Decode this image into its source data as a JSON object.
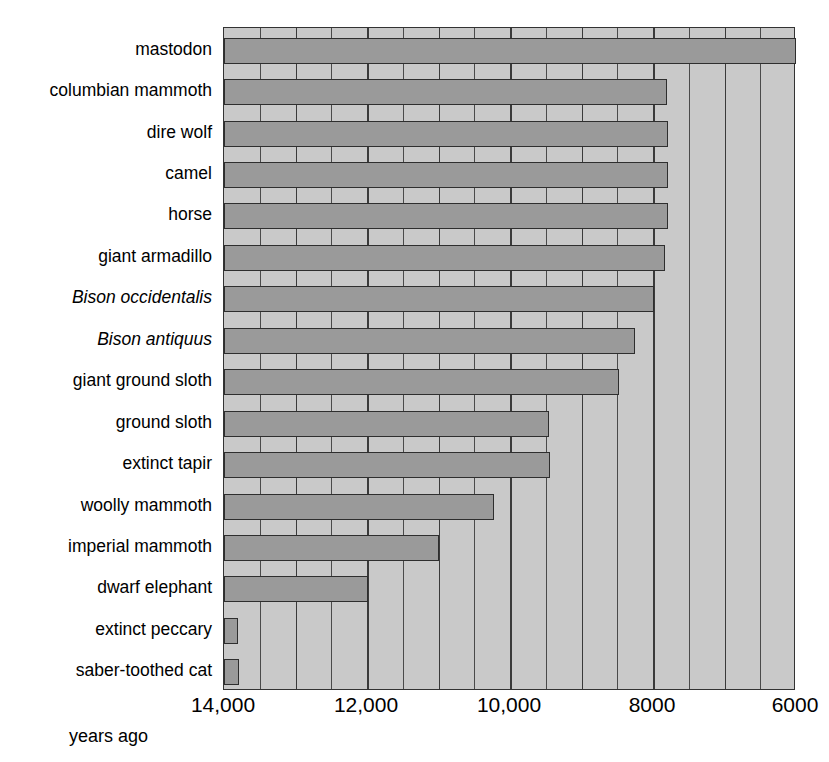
{
  "chart_data": {
    "type": "bar",
    "orientation": "horizontal",
    "title": "",
    "xlabel": "years ago",
    "ylabel": "",
    "xlim": [
      14000,
      6000
    ],
    "x_reversed": true,
    "grid": true,
    "gridline_step": 500,
    "legend": "none",
    "tick_labels": [
      "14,000",
      "12,000",
      "10,000",
      "8000",
      "6000"
    ],
    "tick_values": [
      14000,
      12000,
      10000,
      8000,
      6000
    ],
    "categories": [
      "mastodon",
      "columbian mammoth",
      "dire wolf",
      "camel",
      "horse",
      "giant armadillo",
      "Bison occidentalis",
      "Bison antiquus",
      "giant ground sloth",
      "ground sloth",
      "extinct tapir",
      "woolly mammoth",
      "imperial mammoth",
      "dwarf elephant",
      "extinct peccary",
      "saber-toothed cat"
    ],
    "bar_start": 14000,
    "values": [
      6000,
      7800,
      7790,
      7790,
      7790,
      7830,
      7980,
      8250,
      8470,
      9450,
      9440,
      10220,
      11000,
      11980,
      13800,
      13790
    ],
    "italic_categories": [
      "Bison occidentalis",
      "Bison antiquus"
    ],
    "colors": {
      "bar_fill": "#9a9a9a",
      "bar_stroke": "#2e2e2e",
      "plot_background": "#c9c9c9",
      "gridline": "#4a4a4a",
      "axis": "#333333",
      "text": "#000000",
      "page_background": "#ffffff"
    }
  }
}
